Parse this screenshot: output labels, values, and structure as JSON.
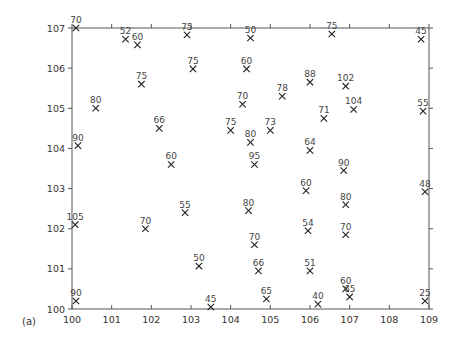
{
  "panel_label": "(a)",
  "chart_data": {
    "type": "scatter",
    "title": "",
    "xlabel": "",
    "ylabel": "",
    "xlim": [
      100,
      109
    ],
    "ylim": [
      100,
      107
    ],
    "grid": false,
    "legend": null,
    "marker": "x",
    "x_ticks": [
      100,
      101,
      102,
      103,
      104,
      105,
      106,
      107,
      108,
      109
    ],
    "y_ticks": [
      100,
      101,
      102,
      103,
      104,
      105,
      106,
      107
    ],
    "x_tick_labels": [
      "100",
      "101",
      "102",
      "103",
      "104",
      "105",
      "106",
      "107",
      "108",
      "109"
    ],
    "y_tick_labels": [
      "100",
      "101",
      "102",
      "103",
      "104",
      "105",
      "106",
      "107"
    ],
    "points": [
      {
        "x": 100.1,
        "y": 107.0,
        "label": "70"
      },
      {
        "x": 101.35,
        "y": 106.72,
        "label": "52"
      },
      {
        "x": 101.65,
        "y": 106.58,
        "label": "60"
      },
      {
        "x": 102.9,
        "y": 106.83,
        "label": "75"
      },
      {
        "x": 104.5,
        "y": 106.75,
        "label": "50"
      },
      {
        "x": 106.55,
        "y": 106.85,
        "label": "75"
      },
      {
        "x": 108.8,
        "y": 106.72,
        "label": "45"
      },
      {
        "x": 103.05,
        "y": 105.98,
        "label": "75"
      },
      {
        "x": 104.4,
        "y": 105.98,
        "label": "60"
      },
      {
        "x": 106.0,
        "y": 105.65,
        "label": "88"
      },
      {
        "x": 106.9,
        "y": 105.55,
        "label": "102"
      },
      {
        "x": 101.75,
        "y": 105.6,
        "label": "75"
      },
      {
        "x": 100.6,
        "y": 105.0,
        "label": "80"
      },
      {
        "x": 105.3,
        "y": 105.3,
        "label": "78"
      },
      {
        "x": 104.3,
        "y": 105.1,
        "label": "70"
      },
      {
        "x": 107.1,
        "y": 104.97,
        "label": "104"
      },
      {
        "x": 108.85,
        "y": 104.93,
        "label": "55"
      },
      {
        "x": 106.35,
        "y": 104.75,
        "label": "71"
      },
      {
        "x": 100.15,
        "y": 104.07,
        "label": "90"
      },
      {
        "x": 102.2,
        "y": 104.5,
        "label": "66"
      },
      {
        "x": 104.0,
        "y": 104.45,
        "label": "75"
      },
      {
        "x": 105.0,
        "y": 104.45,
        "label": "73"
      },
      {
        "x": 104.5,
        "y": 104.15,
        "label": "80"
      },
      {
        "x": 106.0,
        "y": 103.95,
        "label": "64"
      },
      {
        "x": 102.5,
        "y": 103.6,
        "label": "60"
      },
      {
        "x": 104.6,
        "y": 103.6,
        "label": "95"
      },
      {
        "x": 106.85,
        "y": 103.45,
        "label": "90"
      },
      {
        "x": 105.9,
        "y": 102.95,
        "label": "60"
      },
      {
        "x": 108.9,
        "y": 102.92,
        "label": "48"
      },
      {
        "x": 106.9,
        "y": 102.6,
        "label": "80"
      },
      {
        "x": 102.85,
        "y": 102.4,
        "label": "55"
      },
      {
        "x": 104.45,
        "y": 102.45,
        "label": "80"
      },
      {
        "x": 100.08,
        "y": 102.1,
        "label": "105"
      },
      {
        "x": 101.85,
        "y": 102.0,
        "label": "70"
      },
      {
        "x": 105.95,
        "y": 101.95,
        "label": "54"
      },
      {
        "x": 106.9,
        "y": 101.85,
        "label": "70"
      },
      {
        "x": 104.6,
        "y": 101.6,
        "label": "70"
      },
      {
        "x": 103.2,
        "y": 101.07,
        "label": "50"
      },
      {
        "x": 104.7,
        "y": 100.95,
        "label": "66"
      },
      {
        "x": 106.0,
        "y": 100.95,
        "label": "51"
      },
      {
        "x": 100.1,
        "y": 100.2,
        "label": "90"
      },
      {
        "x": 106.9,
        "y": 100.5,
        "label": "60"
      },
      {
        "x": 107.0,
        "y": 100.3,
        "label": "65"
      },
      {
        "x": 103.5,
        "y": 100.05,
        "label": "45"
      },
      {
        "x": 104.9,
        "y": 100.25,
        "label": "65"
      },
      {
        "x": 106.2,
        "y": 100.12,
        "label": "40"
      },
      {
        "x": 108.9,
        "y": 100.2,
        "label": "25"
      }
    ]
  },
  "colors": {
    "axis": "#555555",
    "marker": "#222222",
    "text": "#333333"
  }
}
